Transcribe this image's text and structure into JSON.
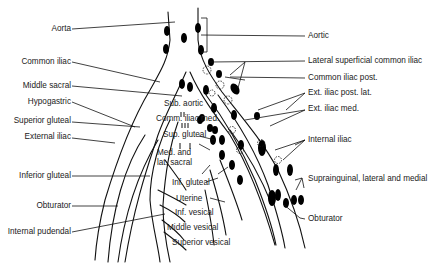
{
  "diagram": {
    "left_labels": [
      {
        "id": "aorta",
        "text": "Aorta"
      },
      {
        "id": "common-iliac",
        "text": "Common iliac"
      },
      {
        "id": "middle-sacral",
        "text": "Middle sacral"
      },
      {
        "id": "hypogastric",
        "text": "Hypogastric"
      },
      {
        "id": "superior-gluteal",
        "text": "Superior gluteal"
      },
      {
        "id": "external-iliac",
        "text": "External iliac"
      },
      {
        "id": "inferior-gluteal",
        "text": "Inferior gluteal"
      },
      {
        "id": "obturator-artery",
        "text": "Obturator"
      },
      {
        "id": "internal-pudendal",
        "text": "Internal pudendal"
      }
    ],
    "center_labels": [
      {
        "id": "sub-aortic",
        "text": "Sub. aortic"
      },
      {
        "id": "comm-iliac-med",
        "text": "Comm. iliac med."
      },
      {
        "id": "sup-gluteal",
        "text": "Sup. gluteal"
      },
      {
        "id": "med-lat-sacral-1",
        "text": "Med. and"
      },
      {
        "id": "med-lat-sacral-2",
        "text": "lat. sacral"
      },
      {
        "id": "inf-gluteal",
        "text": "Inf. gluteal"
      },
      {
        "id": "uterine",
        "text": "Uterine"
      },
      {
        "id": "inf-vesical",
        "text": "Inf. vesical"
      },
      {
        "id": "middle-vesical",
        "text": "Middle vesical"
      },
      {
        "id": "superior-vesical",
        "text": "Superior vesical"
      }
    ],
    "right_labels": [
      {
        "id": "aortic",
        "text": "Aortic"
      },
      {
        "id": "lateral-superficial-common-iliac",
        "text": "Lateral superficial common iliac"
      },
      {
        "id": "common-iliac-post",
        "text": "Common iliac post."
      },
      {
        "id": "ext-iliac-post-lat",
        "text": "Ext. iliac post. lat."
      },
      {
        "id": "ext-iliac-med",
        "text": "Ext. iliac med."
      },
      {
        "id": "internal-iliac",
        "text": "Internal iliac"
      },
      {
        "id": "suprainguinal",
        "text": "Suprainguinal, lateral and medial"
      },
      {
        "id": "obturator-node",
        "text": "Obturator"
      }
    ],
    "colors": {
      "line": "#111111",
      "node": "#000000",
      "background": "#ffffff",
      "text": "#222222"
    }
  }
}
